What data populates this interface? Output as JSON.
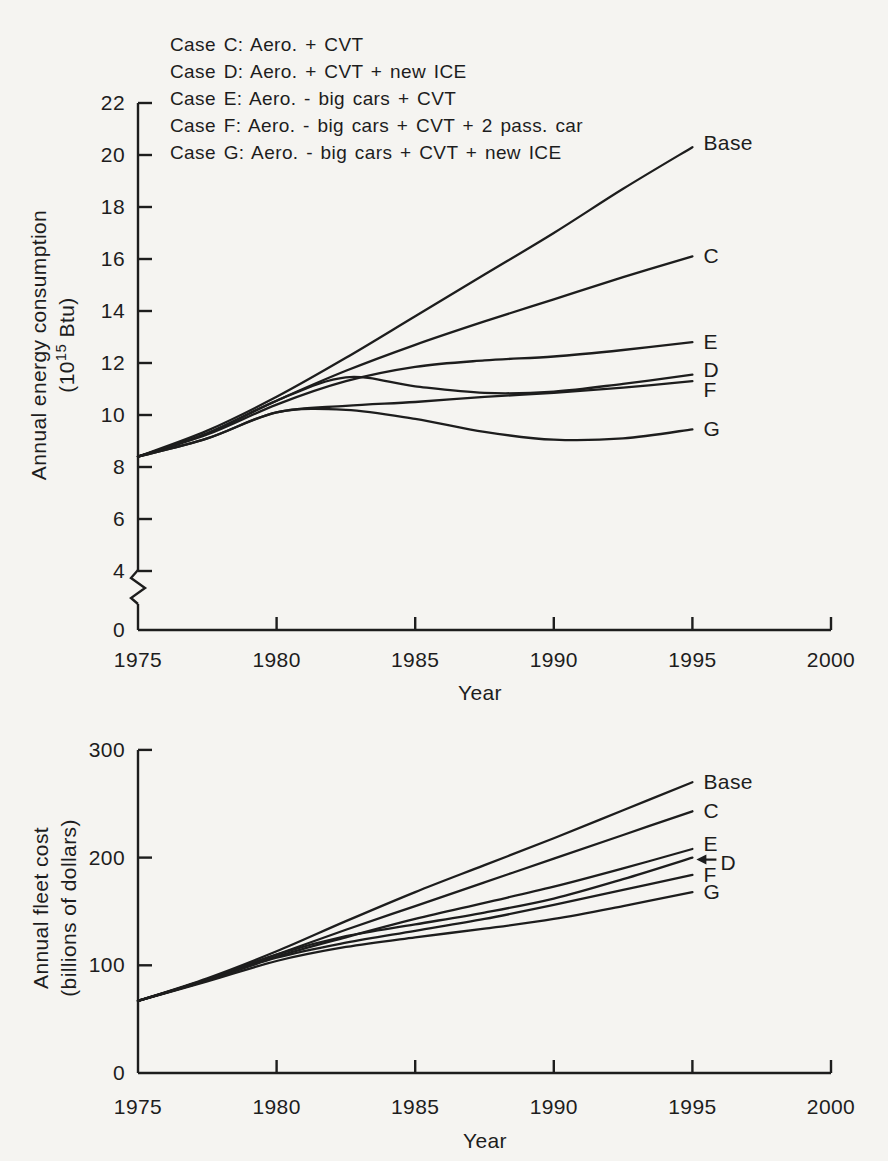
{
  "page": {
    "paper_color": "#f5f4f1",
    "ink_color": "#1d1d1d"
  },
  "figure": {
    "legend": [
      "Case C: Aero. + CVT",
      "Case D: Aero. + CVT + new ICE",
      "Case E: Aero. - big cars + CVT",
      "Case F: Aero. - big cars + CVT + 2 pass. car",
      "Case G: Aero. - big cars + CVT + new ICE"
    ]
  },
  "chart_data": [
    {
      "type": "line",
      "title": "",
      "xlabel": "Year",
      "ylabel": "Annual energy consumption",
      "ylabel_unit": {
        "pre": "(10",
        "sup": "15",
        "post": " Btu)"
      },
      "xlim": [
        1975,
        2000
      ],
      "ylim": [
        0,
        22
      ],
      "y_axis_break": "between 0 and 4",
      "grid": false,
      "legend_position": "above-top-left",
      "xticks": [
        1975,
        1980,
        1985,
        1990,
        1995,
        2000
      ],
      "yticks": [
        0,
        4,
        6,
        8,
        10,
        12,
        14,
        16,
        18,
        20,
        22
      ],
      "x": [
        1975,
        1977.5,
        1980,
        1982.5,
        1985,
        1987.5,
        1990,
        1992.5,
        1995
      ],
      "series": [
        {
          "name": "Base",
          "values": [
            8.4,
            9.4,
            10.7,
            12.2,
            13.8,
            15.4,
            17.0,
            18.7,
            20.3
          ]
        },
        {
          "name": "C",
          "values": [
            8.4,
            9.3,
            10.55,
            11.7,
            12.7,
            13.6,
            14.45,
            15.3,
            16.1
          ]
        },
        {
          "name": "E",
          "values": [
            8.4,
            9.25,
            10.4,
            11.3,
            11.85,
            12.1,
            12.25,
            12.5,
            12.8
          ]
        },
        {
          "name": "D",
          "values": [
            8.4,
            9.3,
            10.55,
            11.45,
            11.1,
            10.85,
            10.9,
            11.2,
            11.55
          ]
        },
        {
          "name": "F",
          "values": [
            8.4,
            9.1,
            10.1,
            10.35,
            10.5,
            10.7,
            10.85,
            11.05,
            11.3
          ]
        },
        {
          "name": "G",
          "values": [
            8.4,
            9.1,
            10.1,
            10.2,
            9.85,
            9.35,
            9.05,
            9.1,
            9.45
          ]
        }
      ]
    },
    {
      "type": "line",
      "title": "",
      "xlabel": "Year",
      "ylabel": "Annual fleet cost",
      "ylabel_unit": {
        "pre": "(billions of dollars)",
        "sup": "",
        "post": ""
      },
      "xlim": [
        1975,
        2000
      ],
      "ylim": [
        0,
        300
      ],
      "grid": false,
      "xticks": [
        1975,
        1980,
        1985,
        1990,
        1995,
        2000
      ],
      "yticks": [
        0,
        100,
        200,
        300
      ],
      "x": [
        1975,
        1977.5,
        1980,
        1982.5,
        1985,
        1987.5,
        1990,
        1992.5,
        1995
      ],
      "series": [
        {
          "name": "Base",
          "values": [
            67,
            88,
            113,
            141,
            168,
            193,
            218,
            244,
            270
          ]
        },
        {
          "name": "C",
          "values": [
            67,
            87,
            110,
            133,
            155,
            177,
            199,
            221,
            243
          ]
        },
        {
          "name": "E",
          "values": [
            67,
            86,
            108,
            126,
            143,
            158,
            173,
            190,
            208
          ]
        },
        {
          "name": "D",
          "values": [
            67,
            87,
            110,
            127,
            138,
            149,
            162,
            180,
            200
          ],
          "label_arrow": true
        },
        {
          "name": "F",
          "values": [
            67,
            86,
            107,
            121,
            132,
            143,
            156,
            170,
            184
          ]
        },
        {
          "name": "G",
          "values": [
            67,
            85,
            104,
            117,
            126,
            134,
            143,
            155,
            168
          ]
        }
      ]
    }
  ]
}
